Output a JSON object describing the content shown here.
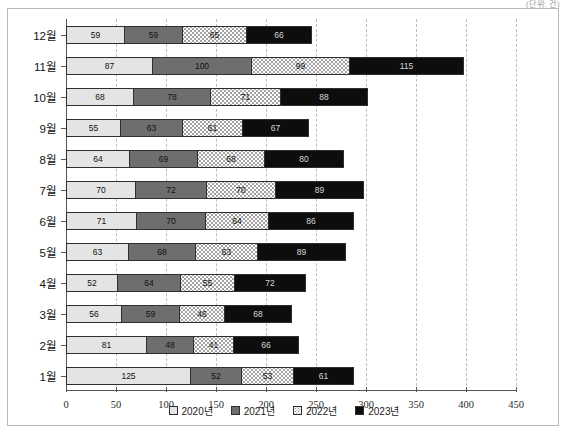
{
  "unit_note": "(단위: 건)",
  "chart_data": {
    "type": "bar",
    "orientation": "horizontal",
    "stacked": true,
    "title": "",
    "xlabel": "",
    "ylabel": "",
    "xlim": [
      0,
      450
    ],
    "xticks": [
      0,
      50,
      100,
      150,
      200,
      250,
      300,
      350,
      400,
      450
    ],
    "grid": true,
    "legend_position": "bottom",
    "categories": [
      "12월",
      "11월",
      "10월",
      "9월",
      "8월",
      "7월",
      "6월",
      "5월",
      "4월",
      "3월",
      "2월",
      "1월"
    ],
    "series": [
      {
        "name": "2020년",
        "color": "#e4e4e4",
        "values": [
          59,
          87,
          68,
          55,
          64,
          70,
          71,
          63,
          52,
          56,
          81,
          125
        ]
      },
      {
        "name": "2021년",
        "color": "#6e6e6e",
        "values": [
          59,
          100,
          78,
          63,
          69,
          72,
          70,
          68,
          64,
          59,
          48,
          52
        ]
      },
      {
        "name": "2022년",
        "color": "#fcfcfc",
        "values": [
          65,
          99,
          71,
          61,
          68,
          70,
          64,
          63,
          55,
          46,
          41,
          53
        ]
      },
      {
        "name": "2023년",
        "color": "#0d0d0d",
        "values": [
          66,
          115,
          88,
          67,
          80,
          89,
          86,
          89,
          72,
          68,
          66,
          61
        ]
      }
    ],
    "totals": [
      249,
      401,
      305,
      246,
      281,
      301,
      291,
      283,
      243,
      229,
      236,
      291
    ]
  }
}
